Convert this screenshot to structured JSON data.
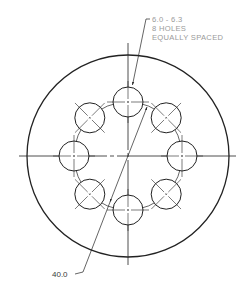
{
  "drawing": {
    "type": "bolt-hole-circle-flange",
    "outer_circle": {
      "cx": 128,
      "cy": 156,
      "r": 101
    },
    "bolt_circle": {
      "cx": 128,
      "cy": 156,
      "r": 54
    },
    "hole_radius": 15,
    "hole_count": 8,
    "line_color": "#222222",
    "text_color": "#9a9a9a"
  },
  "callouts": {
    "hole_note": {
      "line1": "6.0 - 6.3",
      "line2": "8 HOLES",
      "line3": "EQUALLY SPACED"
    },
    "bolt_circle_diameter": "40.0"
  }
}
